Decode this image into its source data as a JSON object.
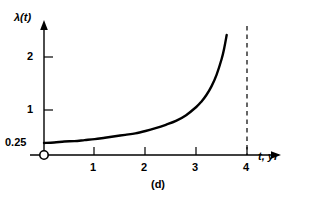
{
  "chart_data": {
    "type": "line",
    "title": "",
    "caption": "(d)",
    "xlabel": "t, yr",
    "ylabel": "λ(t)",
    "xlim": [
      0,
      4.6
    ],
    "ylim": [
      0,
      2.65
    ],
    "grid": false,
    "legend": null,
    "x_ticks": [
      1,
      2,
      3,
      4
    ],
    "x_tick_labels": [
      "1",
      "2",
      "3",
      "4"
    ],
    "y_ticks": [
      0.25,
      1,
      2
    ],
    "y_tick_labels": [
      "0.25",
      "1",
      "2"
    ],
    "origin_marker": "open-circle",
    "series": [
      {
        "name": "hazard-rate",
        "style": "solid",
        "color": "#000000",
        "x": [
          0.0,
          0.2,
          0.4,
          0.6,
          0.8,
          1.0,
          1.2,
          1.4,
          1.6,
          1.8,
          2.0,
          2.2,
          2.4,
          2.6,
          2.8,
          3.0,
          3.1,
          3.2,
          3.3,
          3.4,
          3.5,
          3.55,
          3.6
        ],
        "y": [
          0.25,
          0.26,
          0.28,
          0.29,
          0.31,
          0.33,
          0.36,
          0.39,
          0.42,
          0.45,
          0.5,
          0.56,
          0.63,
          0.71,
          0.83,
          1.0,
          1.11,
          1.25,
          1.43,
          1.67,
          2.0,
          2.22,
          2.5
        ]
      }
    ],
    "annotations": [
      {
        "name": "asymptote",
        "type": "vline",
        "x": 4,
        "style": "dashed",
        "color": "#000000"
      }
    ]
  },
  "figure": {
    "caption": "(d)",
    "y_axis_title": "λ(t)",
    "x_axis_title": "t, yr",
    "y_tick_2": "2",
    "y_tick_1": "1",
    "y_tick_025": "0.25",
    "x_tick_1": "1",
    "x_tick_2": "2",
    "x_tick_3": "3",
    "x_tick_4": "4",
    "colors": {
      "background": "#ffffff",
      "ink": "#000000",
      "curve": "#000000",
      "asymptote": "#000000"
    }
  }
}
